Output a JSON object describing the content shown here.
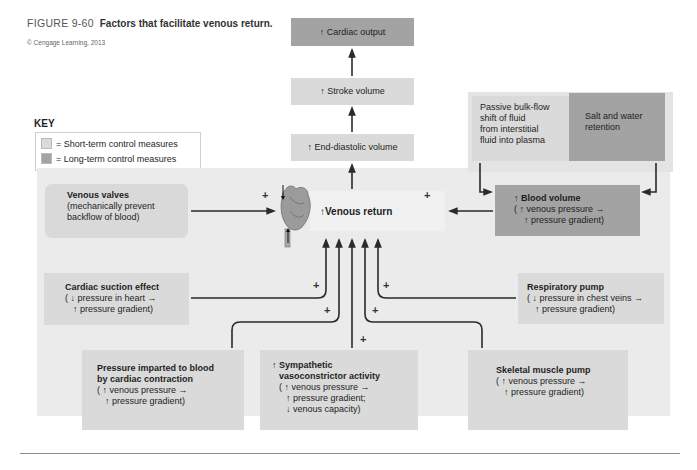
{
  "figure": {
    "number": "FIGURE 9-60",
    "caption": "Factors that facilitate venous return.",
    "credit": "© Cengage Learning, 2013"
  },
  "key": {
    "title": "KEY",
    "items": [
      {
        "label": "= Short-term control measures",
        "color": "#dadada"
      },
      {
        "label": "= Long-term control measures",
        "color": "#a3a3a3"
      }
    ]
  },
  "chain": {
    "cardiac_output": "↑ Cardiac output",
    "stroke_volume": "↑ Stroke volume",
    "end_diastolic_volume": "↑ End-diastolic volume",
    "venous_return": "↑Venous return"
  },
  "blood_volume_inputs": {
    "passive_bulk_flow": [
      "Passive bulk-flow",
      "shift of fluid",
      "from interstitial",
      "fluid into plasma"
    ],
    "salt_water": [
      "Salt and water",
      "retention"
    ]
  },
  "factors": {
    "venous_valves": {
      "title": "Venous valves",
      "lines": [
        "(mechanically prevent",
        "backflow of blood)"
      ]
    },
    "blood_volume": {
      "title": "↑ Blood volume",
      "lines": [
        "( ↑ venous pressure →",
        "↑ pressure gradient)"
      ]
    },
    "cardiac_suction": {
      "title": "Cardiac suction effect",
      "lines": [
        "( ↓ pressure in heart →",
        "↑ pressure gradient)"
      ]
    },
    "respiratory_pump": {
      "title": "Respiratory pump",
      "lines": [
        "( ↓ pressure in chest veins →",
        "↑ pressure gradient)"
      ]
    },
    "cardiac_contraction": {
      "title1": "Pressure imparted to blood",
      "title2": "by cardiac contraction",
      "lines": [
        "( ↑ venous pressure →",
        "↑ pressure gradient)"
      ]
    },
    "sympathetic": {
      "title1": "↑ Sympathetic",
      "title2": "vasoconstrictor activity",
      "lines": [
        "( ↑ venous pressure →",
        "↑ pressure gradient;",
        "↓ venous capacity)"
      ]
    },
    "skeletal_pump": {
      "title": "Skeletal muscle pump",
      "lines": [
        "( ↑ venous pressure →",
        "↑ pressure gradient)"
      ]
    }
  },
  "signs": {
    "plus": "+"
  },
  "colors": {
    "short_term": "#dadada",
    "long_term": "#a3a3a3",
    "panel": "#ebebeb",
    "arrow": "#2a2a2a"
  }
}
